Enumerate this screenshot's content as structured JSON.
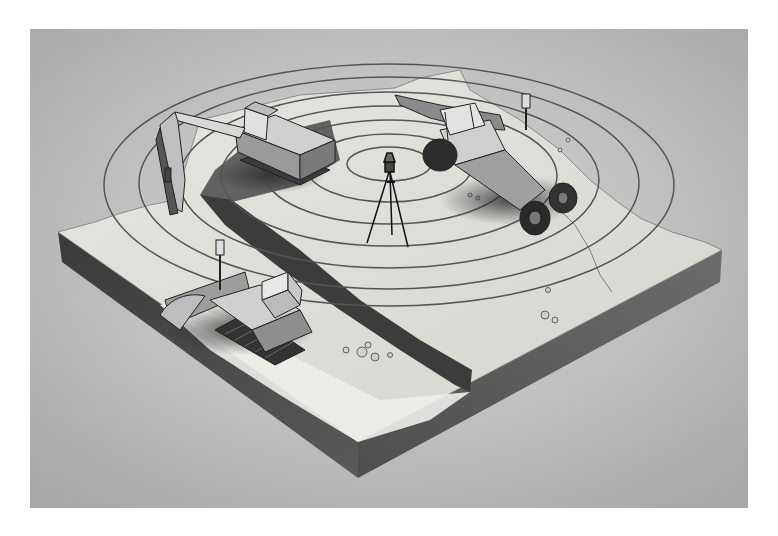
{
  "image": {
    "kind": "technical illustration",
    "style": "grayscale pencil/airbrush rendering",
    "subject": "rotating laser level on tripod emitting concentric leveling rings over an isometric earthwork site",
    "colors": {
      "page": "#ffffff",
      "background_light": "#d9d9d9",
      "background_dark": "#a9a9a9",
      "ground_top": "#e4e2dc",
      "ground_side": "#4a4a4a",
      "trench": "#3c3c3c",
      "rings": "#555555"
    }
  },
  "scene": {
    "laser_level": {
      "label": "laser-transmitter-on-tripod",
      "center": [
        390,
        165
      ]
    },
    "rings": {
      "count": 7,
      "center": [
        390,
        183
      ],
      "outer_rx": 285,
      "outer_ry": 122
    },
    "machines": [
      {
        "name": "excavator",
        "position": "upper-left"
      },
      {
        "name": "wheel-loader-with-receiver-mast",
        "position": "upper-right"
      },
      {
        "name": "crawler-dozer-with-receiver-mast",
        "position": "lower-left"
      }
    ],
    "ground_slab": {
      "corners": {
        "left": [
          58,
          232
        ],
        "top": [
          430,
          90
        ],
        "right": [
          722,
          250
        ],
        "bottom": [
          358,
          442
        ]
      }
    },
    "trench": {
      "from": [
        200,
        195
      ],
      "to": [
        470,
        380
      ]
    }
  }
}
